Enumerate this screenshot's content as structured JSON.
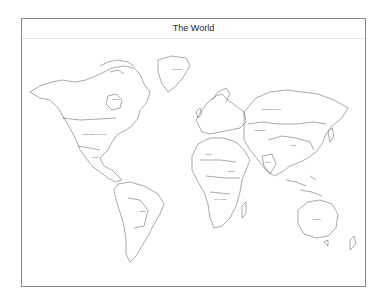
{
  "map": {
    "title": "The World",
    "labels": [
      {
        "name": "Greenland",
        "x": 175,
        "y": 70
      },
      {
        "name": "Canada",
        "x": 115,
        "y": 100
      },
      {
        "name": "United States of America",
        "x": 90,
        "y": 144
      },
      {
        "name": "Mexico",
        "x": 95,
        "y": 165
      },
      {
        "name": "Brazil",
        "x": 145,
        "y": 210
      },
      {
        "name": "Russian Federation",
        "x": 270,
        "y": 110
      },
      {
        "name": "China",
        "x": 290,
        "y": 140
      },
      {
        "name": "Kazakhstan",
        "x": 258,
        "y": 131
      },
      {
        "name": "India",
        "x": 266,
        "y": 162
      },
      {
        "name": "Australia",
        "x": 318,
        "y": 220
      },
      {
        "name": "Algeria",
        "x": 210,
        "y": 160
      },
      {
        "name": "Sudan",
        "x": 228,
        "y": 178
      },
      {
        "name": "D.R. Congo",
        "x": 219,
        "y": 197
      }
    ]
  }
}
